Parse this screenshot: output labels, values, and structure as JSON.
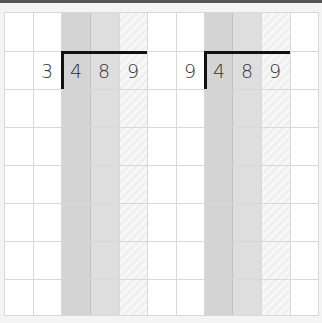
{
  "colors": {
    "hundreds_column": "#d4d4d4",
    "tens_column": "#dedede",
    "ones_column": "#f4f4f4",
    "grid_line": "#d8d8d8",
    "bracket": "#111111",
    "digit": "#333333"
  },
  "grid": {
    "columns": 11,
    "rows": 8
  },
  "problems": [
    {
      "divisor": "3",
      "dividend_digits": [
        "4",
        "8",
        "9"
      ]
    },
    {
      "divisor": "9",
      "dividend_digits": [
        "4",
        "8",
        "9"
      ]
    }
  ]
}
